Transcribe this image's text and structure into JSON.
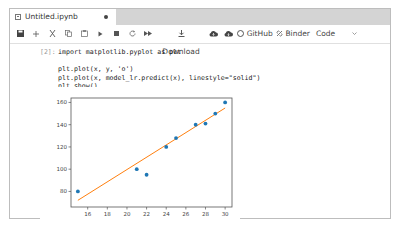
{
  "tab": {
    "title": "Untitled.ipynb",
    "dirty": true
  },
  "toolbar": {
    "icons": [
      "save-icon",
      "add-icon",
      "cut-icon",
      "copy-icon",
      "paste-icon",
      "run-icon",
      "stop-icon",
      "restart-icon",
      "fast-forward-icon"
    ],
    "download_label": "Download",
    "github_label": "GitHub",
    "binder_label": "Binder",
    "cell_type": "Code"
  },
  "cell": {
    "prompt": "[2]:",
    "lines": [
      "import matplotlib.pyplot as plt",
      "",
      "plt.plot(x, y, 'o')",
      "plt.plot(x, model_lr.predict(x), linestyle=\"solid\")",
      "plt.show()"
    ]
  },
  "chart_data": {
    "type": "scatter",
    "title": "",
    "xlabel": "",
    "ylabel": "",
    "xlim": [
      14.3,
      30.7
    ],
    "ylim": [
      66,
      164
    ],
    "x_ticks": [
      16,
      18,
      20,
      22,
      24,
      26,
      28,
      30
    ],
    "y_ticks": [
      80,
      100,
      120,
      140,
      160
    ],
    "grid": false,
    "series": [
      {
        "name": "data",
        "style": "points",
        "x": [
          15,
          21,
          22,
          24,
          25,
          27,
          28,
          29,
          30
        ],
        "y": [
          80,
          100,
          95,
          120,
          128,
          140,
          141,
          150,
          160
        ]
      },
      {
        "name": "model_lr.predict",
        "style": "line",
        "x": [
          15,
          30
        ],
        "y": [
          72,
          155
        ]
      }
    ],
    "colors": {
      "points": "#1f77b4",
      "line": "#ff7f0e"
    }
  }
}
